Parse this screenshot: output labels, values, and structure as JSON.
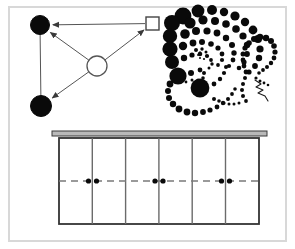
{
  "figure": {
    "canvas": {
      "width": 295,
      "height": 249,
      "background": "#ffffff"
    },
    "frame": {
      "name": "outer-frame",
      "x": 9,
      "y": 7,
      "width": 277,
      "height": 234,
      "stroke": "#d8d8d8",
      "stroke_width": 2,
      "fill": "#ffffff"
    },
    "panels": [
      {
        "id": "node-diagram",
        "label": "node and arrow diagram"
      },
      {
        "id": "dot-spiral",
        "label": "dotted spiral pattern"
      },
      {
        "id": "cell-grid",
        "label": "six cell grid with dashed centerline"
      }
    ]
  },
  "node_diagram": {
    "name": "node-diagram",
    "stroke": "#555555",
    "stroke_width": 1,
    "nodes": [
      {
        "id": "node-top-left",
        "shape": "circle",
        "fill": "#0a0a0a",
        "stroke": "#0a0a0a",
        "cx": 40,
        "cy": 25,
        "r": 9.5
      },
      {
        "id": "node-bottom-left",
        "shape": "circle",
        "fill": "#0a0a0a",
        "stroke": "#0a0a0a",
        "cx": 41,
        "cy": 106,
        "r": 10.5
      },
      {
        "id": "node-center",
        "shape": "circle",
        "fill": "#ffffff",
        "stroke": "#555555",
        "cx": 97,
        "cy": 66,
        "r": 10
      },
      {
        "id": "node-square",
        "shape": "square",
        "fill": "#ffffff",
        "stroke": "#444444",
        "x": 146,
        "y": 17,
        "size": 13
      }
    ],
    "edges": [
      {
        "id": "edge-square-to-topleft",
        "from": "node-square",
        "to": "node-top-left",
        "arrow": true
      },
      {
        "id": "edge-center-to-topleft",
        "from": "node-center",
        "to": "node-top-left",
        "arrow": true
      },
      {
        "id": "edge-center-to-square",
        "from": "node-center",
        "to": "node-square",
        "arrow": true
      },
      {
        "id": "edge-center-to-bottomleft",
        "from": "node-center",
        "to": "node-bottom-left",
        "arrow": true
      },
      {
        "id": "edge-topleft-to-bottomleft",
        "from": "node-top-left",
        "to": "node-bottom-left",
        "arrow": false
      }
    ]
  },
  "dot_spiral": {
    "name": "dot-spiral",
    "fill": "#0a0a0a",
    "description": "logarithmic spiral of filled dots decreasing in size toward the center, with a looping dotted tail",
    "center": {
      "x": 203,
      "y": 55
    },
    "dots": [
      {
        "cx": 183,
        "cy": 16,
        "r": 8.4
      },
      {
        "cx": 198,
        "cy": 11,
        "r": 6.4
      },
      {
        "cx": 212,
        "cy": 10,
        "r": 5.0
      },
      {
        "cx": 224,
        "cy": 12,
        "r": 4.2
      },
      {
        "cx": 235,
        "cy": 16,
        "r": 4.6
      },
      {
        "cx": 245,
        "cy": 22,
        "r": 4.2
      },
      {
        "cx": 253,
        "cy": 30,
        "r": 4.4
      },
      {
        "cx": 258,
        "cy": 39,
        "r": 4.0
      },
      {
        "cx": 260,
        "cy": 49,
        "r": 3.6
      },
      {
        "cx": 259,
        "cy": 58,
        "r": 3.2
      },
      {
        "cx": 255,
        "cy": 66,
        "r": 2.9
      },
      {
        "cx": 249,
        "cy": 72,
        "r": 2.6
      },
      {
        "cx": 172,
        "cy": 23,
        "r": 8.0
      },
      {
        "cx": 190,
        "cy": 23,
        "r": 5.6
      },
      {
        "cx": 203,
        "cy": 20,
        "r": 4.6
      },
      {
        "cx": 215,
        "cy": 21,
        "r": 4.0
      },
      {
        "cx": 226,
        "cy": 24,
        "r": 3.8
      },
      {
        "cx": 236,
        "cy": 29,
        "r": 3.8
      },
      {
        "cx": 243,
        "cy": 36,
        "r": 3.6
      },
      {
        "cx": 247,
        "cy": 45,
        "r": 3.2
      },
      {
        "cx": 247,
        "cy": 54,
        "r": 2.9
      },
      {
        "cx": 244,
        "cy": 62,
        "r": 2.6
      },
      {
        "cx": 239,
        "cy": 68,
        "r": 2.3
      },
      {
        "cx": 170,
        "cy": 36,
        "r": 7.2
      },
      {
        "cx": 185,
        "cy": 34,
        "r": 4.8
      },
      {
        "cx": 196,
        "cy": 31,
        "r": 4.0
      },
      {
        "cx": 207,
        "cy": 31,
        "r": 3.6
      },
      {
        "cx": 217,
        "cy": 33,
        "r": 3.4
      },
      {
        "cx": 226,
        "cy": 38,
        "r": 3.2
      },
      {
        "cx": 232,
        "cy": 45,
        "r": 3.0
      },
      {
        "cx": 234,
        "cy": 53,
        "r": 2.7
      },
      {
        "cx": 233,
        "cy": 60,
        "r": 2.4
      },
      {
        "cx": 229,
        "cy": 66,
        "r": 2.1
      },
      {
        "cx": 170,
        "cy": 49,
        "r": 7.6
      },
      {
        "cx": 183,
        "cy": 46,
        "r": 4.2
      },
      {
        "cx": 193,
        "cy": 43,
        "r": 3.4
      },
      {
        "cx": 202,
        "cy": 42,
        "r": 3.0
      },
      {
        "cx": 211,
        "cy": 44,
        "r": 2.8
      },
      {
        "cx": 218,
        "cy": 48,
        "r": 2.6
      },
      {
        "cx": 222,
        "cy": 54,
        "r": 2.4
      },
      {
        "cx": 222,
        "cy": 60,
        "r": 2.1
      },
      {
        "cx": 218,
        "cy": 65,
        "r": 1.9
      },
      {
        "cx": 172,
        "cy": 62,
        "r": 7.0
      },
      {
        "cx": 184,
        "cy": 58,
        "r": 3.2
      },
      {
        "cx": 192,
        "cy": 55,
        "r": 2.6
      },
      {
        "cx": 200,
        "cy": 54,
        "r": 2.3
      },
      {
        "cx": 207,
        "cy": 56,
        "r": 2.1
      },
      {
        "cx": 211,
        "cy": 60,
        "r": 1.9
      },
      {
        "cx": 212,
        "cy": 64,
        "r": 1.7
      },
      {
        "cx": 209,
        "cy": 68,
        "r": 1.5
      },
      {
        "cx": 196,
        "cy": 50,
        "r": 2.0
      },
      {
        "cx": 202,
        "cy": 49,
        "r": 1.7
      },
      {
        "cx": 206,
        "cy": 52,
        "r": 1.5
      },
      {
        "cx": 207,
        "cy": 56,
        "r": 1.3
      },
      {
        "cx": 204,
        "cy": 59,
        "r": 1.1
      },
      {
        "cx": 200,
        "cy": 58,
        "r": 1.0
      },
      {
        "cx": 198,
        "cy": 55,
        "r": 0.9
      },
      {
        "cx": 200,
        "cy": 52,
        "r": 0.8
      },
      {
        "cx": 178,
        "cy": 76,
        "r": 8.6
      },
      {
        "cx": 191,
        "cy": 73,
        "r": 3.0
      },
      {
        "cx": 200,
        "cy": 70,
        "r": 2.4
      },
      {
        "cx": 204,
        "cy": 73,
        "r": 2.0
      },
      {
        "cx": 203,
        "cy": 78,
        "r": 1.8
      },
      {
        "cx": 198,
        "cy": 80,
        "r": 1.6
      },
      {
        "cx": 192,
        "cy": 80,
        "r": 1.5
      },
      {
        "cx": 186,
        "cy": 82,
        "r": 1.4
      },
      {
        "cx": 200,
        "cy": 88,
        "r": 9.4
      },
      {
        "cx": 214,
        "cy": 84,
        "r": 2.4
      },
      {
        "cx": 220,
        "cy": 79,
        "r": 2.2
      },
      {
        "cx": 224,
        "cy": 73,
        "r": 2.1
      },
      {
        "cx": 226,
        "cy": 67,
        "r": 2.0
      },
      {
        "cx": 170,
        "cy": 84,
        "r": 3.4
      },
      {
        "cx": 168,
        "cy": 91,
        "r": 3.0
      },
      {
        "cx": 169,
        "cy": 98,
        "r": 3.0
      },
      {
        "cx": 173,
        "cy": 104,
        "r": 3.2
      },
      {
        "cx": 179,
        "cy": 109,
        "r": 3.4
      },
      {
        "cx": 187,
        "cy": 112,
        "r": 3.4
      },
      {
        "cx": 195,
        "cy": 113,
        "r": 3.2
      },
      {
        "cx": 203,
        "cy": 112,
        "r": 2.9
      },
      {
        "cx": 210,
        "cy": 110,
        "r": 2.6
      },
      {
        "cx": 217,
        "cy": 107,
        "r": 2.4
      },
      {
        "cx": 223,
        "cy": 103,
        "r": 2.2
      },
      {
        "cx": 228,
        "cy": 99,
        "r": 2.0
      },
      {
        "cx": 232,
        "cy": 94,
        "r": 1.9
      },
      {
        "cx": 235,
        "cy": 89,
        "r": 1.8
      },
      {
        "cx": 214,
        "cy": 99,
        "r": 2.0
      },
      {
        "cx": 219,
        "cy": 101,
        "r": 1.8
      },
      {
        "cx": 224,
        "cy": 103,
        "r": 1.6
      },
      {
        "cx": 229,
        "cy": 104,
        "r": 1.5
      },
      {
        "cx": 234,
        "cy": 104,
        "r": 1.5
      },
      {
        "cx": 239,
        "cy": 103,
        "r": 1.5
      },
      {
        "cx": 246,
        "cy": 72,
        "r": 2.4
      },
      {
        "cx": 244,
        "cy": 66,
        "r": 2.4
      },
      {
        "cx": 243,
        "cy": 60,
        "r": 2.4
      },
      {
        "cx": 243,
        "cy": 54,
        "r": 2.5
      },
      {
        "cx": 245,
        "cy": 48,
        "r": 2.6
      },
      {
        "cx": 249,
        "cy": 43,
        "r": 2.8
      },
      {
        "cx": 254,
        "cy": 39,
        "r": 3.0
      },
      {
        "cx": 260,
        "cy": 37,
        "r": 3.2
      },
      {
        "cx": 266,
        "cy": 38,
        "r": 3.2
      },
      {
        "cx": 271,
        "cy": 41,
        "r": 3.0
      },
      {
        "cx": 274,
        "cy": 46,
        "r": 2.8
      },
      {
        "cx": 275,
        "cy": 52,
        "r": 2.6
      },
      {
        "cx": 274,
        "cy": 58,
        "r": 2.4
      },
      {
        "cx": 271,
        "cy": 63,
        "r": 2.2
      },
      {
        "cx": 267,
        "cy": 67,
        "r": 2.0
      },
      {
        "cx": 263,
        "cy": 70,
        "r": 1.9
      },
      {
        "cx": 259,
        "cy": 73,
        "r": 1.8
      },
      {
        "cx": 245,
        "cy": 78,
        "r": 2.0
      },
      {
        "cx": 243,
        "cy": 84,
        "r": 2.0
      },
      {
        "cx": 242,
        "cy": 90,
        "r": 2.0
      },
      {
        "cx": 243,
        "cy": 96,
        "r": 2.0
      },
      {
        "cx": 246,
        "cy": 101,
        "r": 1.9
      },
      {
        "cx": 256,
        "cy": 78,
        "r": 1.6
      },
      {
        "cx": 260,
        "cy": 81,
        "r": 1.5
      },
      {
        "cx": 264,
        "cy": 83,
        "r": 1.4
      },
      {
        "cx": 268,
        "cy": 85,
        "r": 1.3
      }
    ],
    "squiggle_path": "M 255 80 L 261 84 L 256 87 L 263 90 L 258 93 L 265 96 L 268 101",
    "squiggle_stroke": "#1a1a1a",
    "squiggle_width": 1.1
  },
  "cell_grid": {
    "name": "cell-grid",
    "rail": {
      "name": "top-rail",
      "x": 52,
      "y": 131,
      "width": 215,
      "height": 5,
      "fill": "#b9b9b9",
      "stroke": "#3a3a3a"
    },
    "body": {
      "x": 59,
      "y": 138,
      "width": 200,
      "height": 86,
      "fill": "#ffffff",
      "stroke": "#333333",
      "stroke_width": 1.8
    },
    "columns": 6,
    "divider_stroke": "#6b6b6b",
    "divider_width": 1.4,
    "dividers_x": [
      92.3,
      125.6,
      158.9,
      192.2,
      225.5
    ],
    "centerline": {
      "name": "dashed-centerline",
      "y": 181,
      "x1": 59,
      "x2": 259,
      "stroke": "#7a7a7a",
      "stroke_width": 1.4,
      "dash": "7 5"
    },
    "marker_dots": {
      "fill": "#0a0a0a",
      "r": 2.6,
      "pairs_at_dividers": [
        1,
        3,
        5
      ],
      "positions": [
        {
          "cx": 88.5,
          "cy": 181
        },
        {
          "cx": 96.5,
          "cy": 181
        },
        {
          "cx": 155.0,
          "cy": 181
        },
        {
          "cx": 163.0,
          "cy": 181
        },
        {
          "cx": 221.5,
          "cy": 181
        },
        {
          "cx": 229.5,
          "cy": 181
        }
      ]
    }
  }
}
